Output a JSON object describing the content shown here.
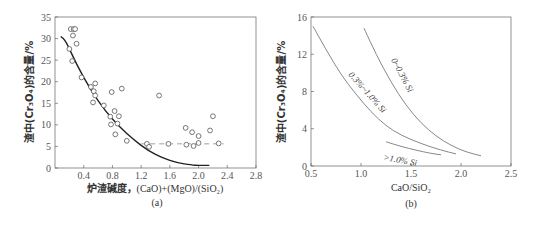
{
  "chart_data": [
    {
      "type": "scatter",
      "panel": "(a)",
      "title": "",
      "xlabel": "炉渣碱度，(CaO)+(MgO)/(SiO₂)",
      "ylabel": "渣中(Cr₃O₄)的含量/%",
      "xlim": [
        0,
        2.8
      ],
      "ylim": [
        0,
        35
      ],
      "xticks": [
        "0.4",
        "0.8",
        "1.2",
        "1.6",
        "2.0",
        "2.4",
        "2.8"
      ],
      "yticks": [
        "0",
        "5",
        "10",
        "15",
        "20",
        "25",
        "30",
        "35"
      ],
      "grid": false,
      "points": [
        [
          0.22,
          32.2
        ],
        [
          0.26,
          32.2
        ],
        [
          0.28,
          32.2
        ],
        [
          0.25,
          30.7
        ],
        [
          0.3,
          28.8
        ],
        [
          0.2,
          27.6
        ],
        [
          0.24,
          24.8
        ],
        [
          0.37,
          21.0
        ],
        [
          0.5,
          18.8
        ],
        [
          0.56,
          19.6
        ],
        [
          0.54,
          17.8
        ],
        [
          0.56,
          16.8
        ],
        [
          0.53,
          15.2
        ],
        [
          0.68,
          14.5
        ],
        [
          0.79,
          17.6
        ],
        [
          0.93,
          18.4
        ],
        [
          0.83,
          13.2
        ],
        [
          0.77,
          11.9
        ],
        [
          0.89,
          12.0
        ],
        [
          0.78,
          10.1
        ],
        [
          0.87,
          10.3
        ],
        [
          0.84,
          7.8
        ],
        [
          1.0,
          6.3
        ],
        [
          1.28,
          5.6
        ],
        [
          1.31,
          4.9
        ],
        [
          1.45,
          16.8
        ],
        [
          1.58,
          5.6
        ],
        [
          1.82,
          9.3
        ],
        [
          1.83,
          5.4
        ],
        [
          1.91,
          8.3
        ],
        [
          1.93,
          5.1
        ],
        [
          2.0,
          7.4
        ],
        [
          2.0,
          5.8
        ],
        [
          2.16,
          8.7
        ],
        [
          2.2,
          12.0
        ],
        [
          2.28,
          5.7
        ]
      ],
      "series": [
        {
          "name": "fit curve",
          "style": "solid",
          "x": [
            0.08,
            0.15,
            0.3,
            0.5,
            0.7,
            0.9,
            1.1,
            1.3,
            1.5,
            1.7,
            1.9,
            2.0,
            2.15
          ],
          "y": [
            30.5,
            29.5,
            24.0,
            18.0,
            13.2,
            9.5,
            6.5,
            4.0,
            2.3,
            1.2,
            0.7,
            0.6,
            0.6
          ]
        },
        {
          "name": "plateau",
          "style": "dashed",
          "x": [
            1.2,
            2.35
          ],
          "y": [
            5.6,
            5.6
          ]
        }
      ],
      "caption": "(a)"
    },
    {
      "type": "line",
      "panel": "(b)",
      "title": "",
      "xlabel": "CaO/SiO₂",
      "ylabel": "渣中(Cr₃O₄)的含量/%",
      "xlim": [
        0.5,
        2.5
      ],
      "ylim": [
        0,
        16
      ],
      "xticks": [
        "0.5",
        "1.0",
        "1.5",
        "2.0",
        "2.5"
      ],
      "yticks": [
        "0",
        "4",
        "8",
        "12",
        "16"
      ],
      "grid": false,
      "series": [
        {
          "name": "0~0.3% Si",
          "x": [
            1.03,
            1.15,
            1.3,
            1.45,
            1.6,
            1.75,
            1.9,
            2.05,
            2.2
          ],
          "y": [
            14.8,
            12.0,
            9.0,
            6.5,
            4.6,
            3.2,
            2.2,
            1.5,
            1.1
          ]
        },
        {
          "name": "0.3%~1.0% Si",
          "x": [
            0.52,
            0.65,
            0.8,
            0.95,
            1.1,
            1.25,
            1.4,
            1.6,
            1.8,
            1.95
          ],
          "y": [
            15.0,
            12.5,
            9.8,
            7.7,
            5.8,
            4.3,
            3.3,
            2.4,
            1.7,
            1.3
          ]
        },
        {
          "name": ">1.0% Si",
          "x": [
            1.25,
            1.4,
            1.55,
            1.7,
            1.8
          ],
          "y": [
            2.6,
            2.1,
            1.7,
            1.35,
            1.2
          ]
        }
      ],
      "caption": "(b)"
    }
  ],
  "labels": {
    "a": {
      "ylabel": "渣中(Cr₃O₄)的含量/%",
      "xlabel_cn": "炉渣碱度，",
      "xlabel_formula": "(CaO)+(MgO)/(SiO₂)",
      "caption": "(a)"
    },
    "b": {
      "ylabel": "渣中(Cr₃O₄)的含量/%",
      "xlabel": "CaO/SiO₂",
      "caption": "(b)",
      "curve1": "0~0.3% Si",
      "curve2": "0.3%~1.0% Si",
      "curve3": ">1.0% Si"
    }
  },
  "colors": {
    "axis": "#666666",
    "fit": "#222222",
    "curve": "#888888",
    "marker": "#555555"
  }
}
